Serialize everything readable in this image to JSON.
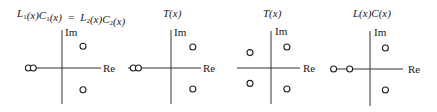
{
  "figure": {
    "panels": [
      {
        "id": "equivalent-loops",
        "title": {
          "parts": [
            {
              "t": "L"
            },
            {
              "t": "1",
              "sub": true
            },
            {
              "t": "(x)C"
            },
            {
              "t": "1",
              "sub": true
            },
            {
              "t": "(x)  =  L"
            },
            {
              "t": "2",
              "sub": true
            },
            {
              "t": "(x)C"
            },
            {
              "t": "2",
              "sub": true
            },
            {
              "t": "(x)"
            }
          ],
          "text": "L1(x)C1(x) = L2(x)C2(x)"
        },
        "im_label": "Im",
        "re_label": "Re",
        "points": [
          {
            "re": -2.4,
            "im": 0,
            "kind": "circle"
          },
          {
            "re": -2.05,
            "im": 0,
            "kind": "circle"
          },
          {
            "re": 1.5,
            "im": 1.5,
            "kind": "circle"
          },
          {
            "re": 1.5,
            "im": -1.5,
            "kind": "circle"
          }
        ]
      },
      {
        "id": "t-first",
        "title": {
          "parts": [
            {
              "t": "T(x)"
            }
          ],
          "text": "T(x)"
        },
        "im_label": "Im",
        "re_label": "Re",
        "points": [
          {
            "re": -2.6,
            "im": 0,
            "kind": "circle"
          },
          {
            "re": -2.25,
            "im": 0,
            "kind": "circle"
          },
          {
            "re": 1.5,
            "im": 1.5,
            "kind": "circle"
          },
          {
            "re": 1.5,
            "im": -1.5,
            "kind": "circle"
          }
        ]
      },
      {
        "id": "t-second",
        "title": {
          "parts": [
            {
              "t": "T(x)"
            }
          ],
          "text": "T(x)"
        },
        "im_label": "Im",
        "re_label": "Re",
        "points": [
          {
            "re": -1.45,
            "im": 1.1,
            "kind": "circle"
          },
          {
            "re": 1.1,
            "im": 1.5,
            "kind": "circle"
          },
          {
            "re": -1.45,
            "im": -1.1,
            "kind": "circle"
          },
          {
            "re": 1.1,
            "im": -1.5,
            "kind": "circle"
          }
        ]
      },
      {
        "id": "lc-product",
        "title": {
          "parts": [
            {
              "t": "L(x)C(x)"
            }
          ],
          "text": "L(x)C(x)"
        },
        "im_label": "Im",
        "re_label": "Re",
        "points": [
          {
            "re": -2.6,
            "im": 0,
            "kind": "circle"
          },
          {
            "re": -1.45,
            "im": 0,
            "kind": "circle"
          },
          {
            "re": 1.1,
            "im": 1.5,
            "kind": "circle"
          },
          {
            "re": 1.1,
            "im": -1.5,
            "kind": "circle"
          }
        ]
      }
    ]
  }
}
